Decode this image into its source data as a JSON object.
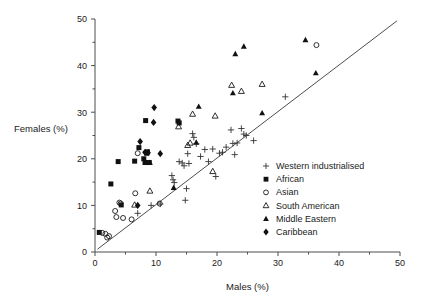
{
  "chart_data": {
    "type": "scatter",
    "title": "",
    "xlabel": "Males (%)",
    "ylabel": "Females (%)",
    "xlim": [
      0,
      50
    ],
    "ylim": [
      0,
      50
    ],
    "xticks": [
      0,
      10,
      20,
      30,
      40,
      50
    ],
    "yticks": [
      0,
      10,
      20,
      30,
      40,
      50
    ],
    "xtick_labels": [
      "0",
      "10",
      "20",
      "30",
      "40",
      "50"
    ],
    "ytick_labels": [
      "0",
      "10",
      "20",
      "30",
      "40",
      "50"
    ],
    "minor_tick_step": 5,
    "grid": false,
    "legend_position": "inside-lower-right",
    "reference_line": {
      "name": "line-of-equality",
      "from": [
        0.4,
        0.6
      ],
      "to": [
        49.5,
        49.6
      ]
    },
    "series": [
      {
        "name": "Western industrialised",
        "marker": "plus",
        "points": [
          [
            12.8,
            15.5
          ],
          [
            13.0,
            14.9
          ],
          [
            12.6,
            16.4
          ],
          [
            13.8,
            19.4
          ],
          [
            14.3,
            19.1
          ],
          [
            14.6,
            18.5
          ],
          [
            14.8,
            11.1
          ],
          [
            15.0,
            13.6
          ],
          [
            15.2,
            21.1
          ],
          [
            15.4,
            19.0
          ],
          [
            16.0,
            25.4
          ],
          [
            16.2,
            24.6
          ],
          [
            16.6,
            23.2
          ],
          [
            17.3,
            20.5
          ],
          [
            18.0,
            22.0
          ],
          [
            18.6,
            19.4
          ],
          [
            19.3,
            22.1
          ],
          [
            19.8,
            16.2
          ],
          [
            20.4,
            21.2
          ],
          [
            20.9,
            21.4
          ],
          [
            21.5,
            22.5
          ],
          [
            22.3,
            26.2
          ],
          [
            22.6,
            23.3
          ],
          [
            22.9,
            20.9
          ],
          [
            23.3,
            23.4
          ],
          [
            24.0,
            26.5
          ],
          [
            24.4,
            25.3
          ],
          [
            24.8,
            25.0
          ],
          [
            26.0,
            23.9
          ],
          [
            31.2,
            33.3
          ],
          [
            10.7,
            10.3
          ],
          [
            7.0,
            8.3
          ],
          [
            9.2,
            10.0
          ]
        ]
      },
      {
        "name": "African",
        "marker": "square-filled",
        "points": [
          [
            0.7,
            4.2
          ],
          [
            2.6,
            14.6
          ],
          [
            3.8,
            19.4
          ],
          [
            6.5,
            19.5
          ],
          [
            7.2,
            22.4
          ],
          [
            8.0,
            20.0
          ],
          [
            8.3,
            28.2
          ],
          [
            8.5,
            21.2
          ],
          [
            8.6,
            21.5
          ],
          [
            8.2,
            19.2
          ],
          [
            8.9,
            19.2
          ],
          [
            4.3,
            10.1
          ],
          [
            13.6,
            28.1
          ],
          [
            13.8,
            27.7
          ]
        ]
      },
      {
        "name": "Asian",
        "marker": "circle-open",
        "points": [
          [
            1.2,
            4.1
          ],
          [
            1.7,
            3.9
          ],
          [
            2.0,
            3.1
          ],
          [
            2.3,
            3.4
          ],
          [
            3.3,
            8.8
          ],
          [
            3.5,
            7.5
          ],
          [
            4.0,
            10.6
          ],
          [
            4.2,
            10.4
          ],
          [
            4.6,
            7.3
          ],
          [
            6.0,
            7.0
          ],
          [
            6.6,
            12.6
          ],
          [
            10.6,
            10.4
          ],
          [
            7.0,
            21.2
          ],
          [
            36.3,
            44.4
          ]
        ]
      },
      {
        "name": "South American",
        "marker": "triangle-open",
        "points": [
          [
            6.5,
            10.1
          ],
          [
            9.0,
            13.1
          ],
          [
            13.7,
            26.9
          ],
          [
            15.2,
            22.9
          ],
          [
            15.6,
            23.4
          ],
          [
            16.0,
            29.6
          ],
          [
            19.3,
            17.3
          ],
          [
            19.7,
            29.2
          ],
          [
            22.4,
            35.8
          ],
          [
            24.0,
            34.5
          ],
          [
            27.4,
            36.0
          ]
        ]
      },
      {
        "name": "Middle Eastern",
        "marker": "triangle-filled",
        "points": [
          [
            12.9,
            13.8
          ],
          [
            16.6,
            23.5
          ],
          [
            17.0,
            31.2
          ],
          [
            22.6,
            34.1
          ],
          [
            23.0,
            42.5
          ],
          [
            24.4,
            44.1
          ],
          [
            27.4,
            29.8
          ],
          [
            34.5,
            45.5
          ],
          [
            36.2,
            38.4
          ],
          [
            9.0,
            19.2
          ]
        ]
      },
      {
        "name": "Caribbean",
        "marker": "diamond-filled",
        "points": [
          [
            7.0,
            10.0
          ],
          [
            9.7,
            31.0
          ],
          [
            9.6,
            27.8
          ],
          [
            7.4,
            23.7
          ],
          [
            8.7,
            21.3
          ],
          [
            10.7,
            21.1
          ],
          [
            8.2,
            21.4
          ]
        ]
      }
    ]
  },
  "legend": {
    "entries": [
      {
        "label": "Western industrialised",
        "marker": "plus"
      },
      {
        "label": "African",
        "marker": "square-filled"
      },
      {
        "label": "Asian",
        "marker": "circle-open"
      },
      {
        "label": "South American",
        "marker": "triangle-open"
      },
      {
        "label": "Middle Eastern",
        "marker": "triangle-filled"
      },
      {
        "label": "Caribbean",
        "marker": "diamond-filled"
      }
    ]
  },
  "colors": {
    "axis": "#4d4d4d",
    "marker": "#111111",
    "text": "#1a1a1a",
    "background": "#ffffff"
  }
}
